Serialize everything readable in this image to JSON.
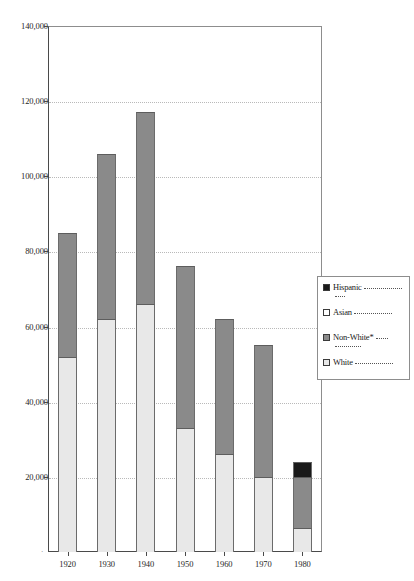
{
  "chart_data": {
    "type": "bar",
    "subtype": "stacked-bar",
    "title": "",
    "xlabel": "",
    "ylabel": "",
    "categories": [
      "1920",
      "1930",
      "1940",
      "1950",
      "1960",
      "1970",
      "1980"
    ],
    "ylim": [
      0,
      140000
    ],
    "y_ticks": [
      {
        "value": 140000,
        "label": "140,000"
      },
      {
        "value": 120000,
        "label": "120,000"
      },
      {
        "value": 100000,
        "label": "100,000"
      },
      {
        "value": 80000,
        "label": "80,000"
      },
      {
        "value": 60000,
        "label": "60,000"
      },
      {
        "value": 40000,
        "label": "40,000"
      },
      {
        "value": 20000,
        "label": "20,000"
      }
    ],
    "grid": true,
    "grid_style": "dotted-horizontal",
    "legend_position": "right",
    "series": [
      {
        "name": "White",
        "color": "#e8e8e8",
        "swatch": "open",
        "values": [
          52000,
          62000,
          66000,
          33000,
          26000,
          20000,
          6500
        ]
      },
      {
        "name": "Non-White*",
        "color": "#8a8a8a",
        "swatch": "filled",
        "values": [
          33000,
          44000,
          51000,
          43000,
          36000,
          35000,
          13500
        ]
      },
      {
        "name": "Asian",
        "color": "#ffffff",
        "swatch": "open",
        "values": [
          0,
          0,
          0,
          0,
          0,
          0,
          0
        ]
      },
      {
        "name": "Hispanic",
        "color": "#1a1a1a",
        "swatch": "filled",
        "values": [
          0,
          0,
          0,
          0,
          0,
          0,
          4000
        ]
      }
    ],
    "totals": [
      85000,
      106000,
      117000,
      76000,
      62000,
      55000,
      24000
    ],
    "stack_order": [
      "White",
      "Non-White*",
      "Hispanic"
    ]
  },
  "legend": {
    "title": "",
    "entries": [
      {
        "label": "Hispanic",
        "swatch": "filled",
        "color": "#1a1a1a",
        "trailer": "——————"
      },
      {
        "label": "Asian",
        "swatch": "open",
        "color": "#ffffff",
        "trailer": "——————"
      },
      {
        "label": "Non-White*",
        "swatch": "filled",
        "color": "#8a8a8a",
        "trailer": "——"
      },
      {
        "label": "White",
        "swatch": "open",
        "color": "#e8e8e8",
        "trailer": "——————"
      }
    ]
  },
  "axis": {
    "origin_marker": "·"
  }
}
